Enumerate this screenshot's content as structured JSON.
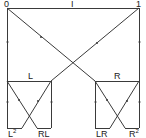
{
  "diagram": {
    "top_labels": {
      "left": "0",
      "middle": "I",
      "right": "1"
    },
    "level1": {
      "left": "L",
      "right": "R"
    },
    "leaves": {
      "ll": {
        "base": "L",
        "sup": "2"
      },
      "rl": "RL",
      "lr": "LR",
      "rr": {
        "base": "R",
        "sup": "2"
      }
    }
  }
}
